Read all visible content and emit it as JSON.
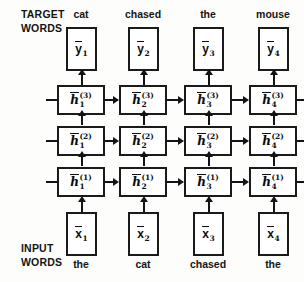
{
  "diagram": {
    "labels": {
      "target_top": "TARGET",
      "target_bottom": "WORDS",
      "input_top": "INPUT",
      "input_bottom": "WORDS"
    },
    "target_words": [
      "cat",
      "chased",
      "the",
      "mouse"
    ],
    "input_words": [
      "the",
      "cat",
      "chased",
      "the"
    ],
    "output_nodes": [
      {
        "symbol": "y",
        "index": "1"
      },
      {
        "symbol": "y",
        "index": "2"
      },
      {
        "symbol": "y",
        "index": "3"
      },
      {
        "symbol": "y",
        "index": "4"
      }
    ],
    "input_nodes": [
      {
        "symbol": "x",
        "index": "1"
      },
      {
        "symbol": "x",
        "index": "2"
      },
      {
        "symbol": "x",
        "index": "3"
      },
      {
        "symbol": "x",
        "index": "4"
      }
    ],
    "hidden_layers": [
      {
        "layer": "(3)",
        "cells": [
          {
            "symbol": "h",
            "index": "1",
            "layer": "(3)"
          },
          {
            "symbol": "h",
            "index": "2",
            "layer": "(3)"
          },
          {
            "symbol": "h",
            "index": "3",
            "layer": "(3)"
          },
          {
            "symbol": "h",
            "index": "4",
            "layer": "(3)"
          }
        ]
      },
      {
        "layer": "(2)",
        "cells": [
          {
            "symbol": "h",
            "index": "1",
            "layer": "(2)"
          },
          {
            "symbol": "h",
            "index": "2",
            "layer": "(2)"
          },
          {
            "symbol": "h",
            "index": "3",
            "layer": "(2)"
          },
          {
            "symbol": "h",
            "index": "4",
            "layer": "(2)"
          }
        ]
      },
      {
        "layer": "(1)",
        "cells": [
          {
            "symbol": "h",
            "index": "1",
            "layer": "(1)"
          },
          {
            "symbol": "h",
            "index": "2",
            "layer": "(1)"
          },
          {
            "symbol": "h",
            "index": "3",
            "layer": "(1)"
          },
          {
            "symbol": "h",
            "index": "4",
            "layer": "(1)"
          }
        ]
      }
    ],
    "colors": {
      "stroke": "#131313",
      "text": "#111111",
      "background": "#fdfdfc"
    }
  }
}
